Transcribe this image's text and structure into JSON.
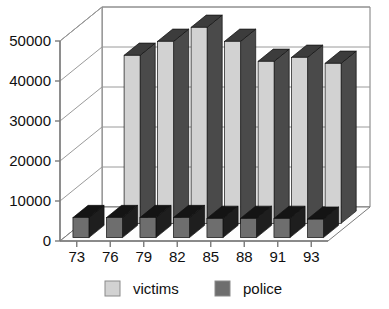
{
  "chart_data": {
    "type": "bar",
    "title": "",
    "subtitle": "",
    "xlabel": "",
    "ylabel": "",
    "categories": [
      "73",
      "76",
      "79",
      "82",
      "85",
      "88",
      "91",
      "93"
    ],
    "series": [
      {
        "name": "victims",
        "color": "#d2d2d2",
        "values": [
          0,
          42000,
          45500,
          49000,
          45500,
          40500,
          41500,
          40000
        ]
      },
      {
        "name": "police",
        "color": "#6e6e6e",
        "values": [
          5000,
          5000,
          5000,
          5000,
          4800,
          4800,
          4800,
          4600
        ]
      }
    ],
    "ylim": [
      0,
      50000
    ],
    "yticks": [
      "0",
      "10000",
      "20000",
      "30000",
      "40000",
      "50000"
    ],
    "ytick_values": [
      0,
      10000,
      20000,
      30000,
      40000,
      50000
    ],
    "grid": true,
    "three_d": true,
    "legend_position": "bottom",
    "legend": [
      {
        "label": "victims",
        "color": "#d2d2d2"
      },
      {
        "label": "police",
        "color": "#6e6e6e"
      }
    ]
  },
  "colors": {
    "background": "#ffffff",
    "axis": "#7a7a7a",
    "gridline": "#9a9a9a",
    "text": "#101010",
    "victims_front": "#d2d2d2",
    "victims_side": "#4a4a4a",
    "victims_top": "#3c3c3c",
    "police_front": "#6e6e6e",
    "police_side": "#1e1e1e",
    "police_top": "#141414",
    "floor": "#fdfdfd",
    "wall": "#ffffff"
  }
}
